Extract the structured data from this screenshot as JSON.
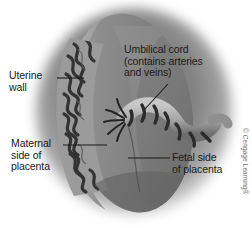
{
  "figure": {
    "background_color": "#ffffff"
  },
  "labels": {
    "uterine_wall": "Uterine\nwall",
    "umbilical_cord": "Umbilical cord\n(contains arteries\nand veins)",
    "maternal_side": "Maternal\nside of\nplacenta",
    "fetal_side": "Fetal side\nof placenta"
  },
  "credit": {
    "text": "© Cengage Learning®",
    "color": "#6d6d6d"
  },
  "colors": {
    "uterus_blur": "#8f8f8f",
    "placenta_body": "#8a8a8a",
    "placenta_rim": "#9e9e9e",
    "maternal_band_dark": "#3a3a3a",
    "cord_light": "#b4b4b4",
    "cord_dark": "#2e2e2e",
    "leader_line": "#1a1a1a",
    "text": "#1a1a1a"
  },
  "parts": [
    {
      "name": "uterine-wall",
      "kind": "blurred-ellipse"
    },
    {
      "name": "placenta-disc",
      "kind": "oval-body"
    },
    {
      "name": "maternal-surface",
      "kind": "wavy-dark-band"
    },
    {
      "name": "fetal-surface",
      "kind": "smooth-face"
    },
    {
      "name": "umbilical-cord",
      "kind": "twisted-striped-tube"
    },
    {
      "name": "cord-vessels",
      "kind": "frayed-strands"
    }
  ]
}
